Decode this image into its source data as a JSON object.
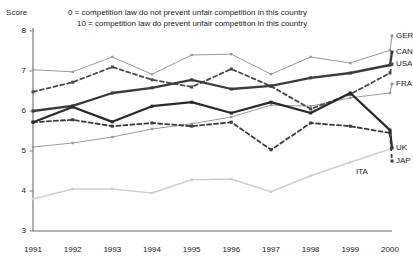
{
  "chart_data": {
    "type": "line",
    "title": "",
    "subtitle_lines": [
      "0 = competition law do not prevent unfair competition in this country",
      "10 = competition law do prevent unfair competition in this country"
    ],
    "ylabel": "Score",
    "xlabel": "",
    "ylim": [
      3,
      8
    ],
    "yticks": [
      3,
      4,
      5,
      6,
      7,
      8
    ],
    "grid": false,
    "legend_position": "right",
    "categories": [
      "1991",
      "1992",
      "1993",
      "1994",
      "1995",
      "1996",
      "1997",
      "1998",
      "1999",
      "2000"
    ],
    "x": [
      1991,
      1992,
      1993,
      1994,
      1995,
      1996,
      1997,
      1998,
      1999,
      2000
    ],
    "series": [
      {
        "name": "GER",
        "color": "#9a9a9a",
        "style": "solid-thin",
        "values": [
          7.03,
          6.98,
          7.35,
          6.92,
          7.4,
          7.42,
          6.92,
          7.35,
          7.2,
          7.52
        ]
      },
      {
        "name": "CAN",
        "color": "#3b3b3b",
        "style": "solid-thick",
        "values": [
          6.0,
          6.13,
          6.45,
          6.58,
          6.78,
          6.55,
          6.63,
          6.83,
          6.95,
          7.15
        ]
      },
      {
        "name": "USA",
        "color": "#4a4a4a",
        "style": "dashed",
        "values": [
          6.48,
          6.72,
          7.1,
          6.78,
          6.6,
          7.05,
          6.62,
          6.05,
          6.42,
          6.95
        ]
      },
      {
        "name": "FRA",
        "color": "#9a9a9a",
        "style": "solid-thin",
        "values": [
          5.1,
          5.2,
          5.35,
          5.55,
          5.68,
          5.85,
          6.15,
          6.12,
          6.33,
          6.45
        ]
      },
      {
        "name": "UK",
        "color": "#2a2a2a",
        "style": "solid-thick",
        "values": [
          5.72,
          6.1,
          5.73,
          6.12,
          6.22,
          5.95,
          6.22,
          5.95,
          6.45,
          5.52
        ]
      },
      {
        "name": "JAP",
        "color": "#3b3b3b",
        "style": "dashed",
        "values": [
          5.72,
          5.78,
          5.62,
          5.7,
          5.62,
          5.72,
          5.03,
          5.7,
          5.62,
          5.45
        ]
      },
      {
        "name": "ITA",
        "color": "#cfcfcf",
        "style": "solid-thin",
        "values": [
          3.8,
          4.05,
          4.05,
          3.95,
          4.28,
          4.3,
          3.98,
          4.38,
          4.72,
          5.05
        ]
      }
    ],
    "inline_annotations": [
      {
        "text": "ITA",
        "series": "ITA"
      }
    ],
    "legend_entries": [
      "GER",
      "CAN",
      "USA",
      "FRA",
      "UK",
      "JAP"
    ]
  },
  "axis": {
    "y_title": "Score",
    "y_ticks": [
      "8",
      "7",
      "6",
      "5",
      "4",
      "3"
    ],
    "x_ticks": [
      "1991",
      "1992",
      "1993",
      "1994",
      "1995",
      "1996",
      "1997",
      "1998",
      "1999",
      "2000"
    ]
  },
  "legend": {
    "items": [
      {
        "label": "GER"
      },
      {
        "label": "CAN"
      },
      {
        "label": "USA"
      },
      {
        "label": "FRA"
      },
      {
        "label": "UK"
      },
      {
        "label": "JAP"
      }
    ],
    "inline": {
      "ita_label": "ITA"
    }
  },
  "header": {
    "line1": "0 = competition law do not prevent unfair competition in this country",
    "line2": "10 = competition law do prevent unfair competition in this country"
  }
}
